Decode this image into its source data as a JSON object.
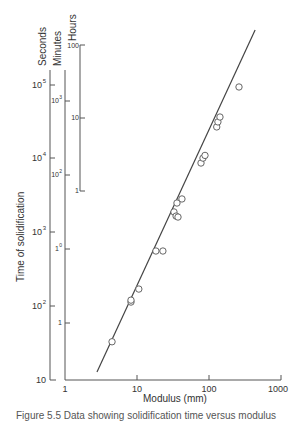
{
  "chart_data": {
    "type": "scatter",
    "title": "",
    "xlabel": "Modulus (mm)",
    "ylabel": "Time of solidification",
    "x_scale": "log",
    "y_scale": "log",
    "xlim": [
      1,
      1000
    ],
    "ylim": [
      10,
      100000
    ],
    "grid": false,
    "x_ticks": [
      "1",
      "10",
      "100",
      "1000"
    ],
    "y_axes": [
      {
        "name": "Seconds",
        "ticks": [
          "10",
          "10²",
          "10³",
          "10⁴",
          "10⁵"
        ],
        "tick_values_seconds": [
          10,
          100,
          1000,
          10000,
          100000
        ]
      },
      {
        "name": "Minutes",
        "ticks": [
          "1",
          "10⁰",
          "10²",
          "10³"
        ],
        "tick_values_minutes": [
          1,
          10,
          100,
          1000
        ]
      },
      {
        "name": "Hours",
        "ticks": [
          "1",
          "10",
          "100"
        ],
        "tick_values_hours": [
          1,
          10,
          100
        ]
      }
    ],
    "series": [
      {
        "name": "Measured castings",
        "marker": "open-circle",
        "x": [
          4.5,
          8.25,
          8.25,
          10.6,
          18.3,
          22.9,
          32.6,
          34.9,
          37.1,
          35.9,
          42.1,
          77.4,
          82.5,
          88.0,
          128,
          133,
          142,
          261
        ],
        "y": [
          33,
          114,
          121,
          171,
          561,
          561,
          1900,
          1670,
          1620,
          2510,
          2850,
          8750,
          10200,
          11100,
          27000,
          31600,
          36800,
          94000
        ]
      },
      {
        "name": "Chvorinov fit line",
        "marker": "line",
        "x": [
          2.78,
          437
        ],
        "y": [
          12.8,
          557000
        ]
      }
    ],
    "legend": "none"
  },
  "labels": {
    "seconds": "Seconds",
    "minutes": "Minutes",
    "hours": "Hours",
    "ylabel": "Time of solidification",
    "xlabel": "Modulus (mm)",
    "caption": "Figure 5.5 Data showing solidification time versus modulus"
  },
  "ticks": {
    "sec": [
      "10",
      "10",
      "10",
      "10",
      "10"
    ],
    "sec_exp": [
      "",
      "2",
      "3",
      "4",
      "5"
    ],
    "min": [
      "1",
      "1",
      "10",
      "10"
    ],
    "min_exp": [
      "",
      "0",
      "2",
      "3"
    ],
    "hr": [
      "1",
      "10",
      "100"
    ],
    "x": [
      "1",
      "10",
      "100",
      "1000"
    ]
  }
}
